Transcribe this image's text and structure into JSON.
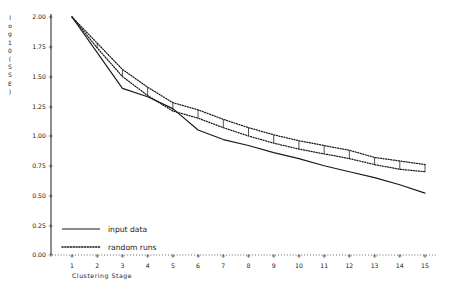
{
  "chart_data": {
    "type": "line",
    "title": "",
    "xlabel": "Clustering Stage",
    "ylabel": "log10(SSE)",
    "ylabel_chars": [
      "l",
      "o",
      "g",
      "1",
      "0",
      "(",
      "S",
      "S",
      "E",
      ")"
    ],
    "xlim": [
      1,
      15
    ],
    "ylim": [
      0.0,
      2.0
    ],
    "grid": false,
    "legend_position": "bottom-left",
    "x": [
      1,
      2,
      3,
      4,
      5,
      6,
      7,
      8,
      9,
      10,
      11,
      12,
      13,
      14,
      15
    ],
    "xtick_labels": [
      "1",
      "2",
      "3",
      "4",
      "5",
      "6",
      "7",
      "8",
      "9",
      "10",
      "11",
      "12",
      "13",
      "14",
      "15"
    ],
    "ytick_labels": [
      "0.00",
      "0.25",
      "0.50",
      "0.75",
      "1.00",
      "1.25",
      "1.50",
      "1.75",
      "2.00"
    ],
    "ytick_values": [
      0.0,
      0.25,
      0.5,
      0.75,
      1.0,
      1.25,
      1.5,
      1.75,
      2.0
    ],
    "series": [
      {
        "name": "input data",
        "style": "solid",
        "values": [
          2.0,
          1.7,
          1.4,
          1.33,
          1.23,
          1.05,
          0.97,
          0.92,
          0.86,
          0.81,
          0.75,
          0.7,
          0.65,
          0.59,
          0.52
        ]
      },
      {
        "name": "random runs",
        "style": "dotted",
        "values": [
          2.0,
          1.76,
          1.53,
          1.38,
          1.25,
          1.19,
          1.11,
          1.04,
          0.98,
          0.93,
          0.89,
          0.85,
          0.79,
          0.76,
          0.73
        ],
        "upper": [
          2.0,
          1.78,
          1.56,
          1.41,
          1.28,
          1.22,
          1.14,
          1.07,
          1.01,
          0.96,
          0.92,
          0.88,
          0.82,
          0.79,
          0.76
        ],
        "lower": [
          2.0,
          1.74,
          1.5,
          1.34,
          1.21,
          1.15,
          1.07,
          1.0,
          0.94,
          0.89,
          0.85,
          0.81,
          0.76,
          0.72,
          0.7
        ]
      }
    ],
    "legend": [
      {
        "label": "input data",
        "style": "solid"
      },
      {
        "label": "random runs",
        "style": "dotted"
      }
    ]
  }
}
